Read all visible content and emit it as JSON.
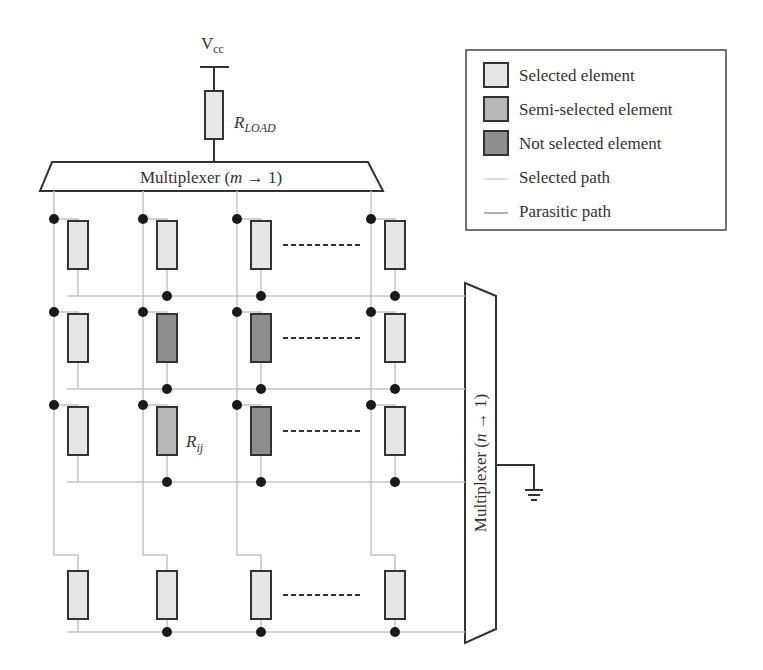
{
  "supply": {
    "label": "V",
    "subscript": "cc"
  },
  "load_resistor": {
    "label": "R",
    "subscript": "LOAD"
  },
  "column_mux": {
    "label": "Multiplexer (",
    "var": "m",
    "arrow": " → 1)"
  },
  "row_mux": {
    "label": "Multiplexer (",
    "var": "n",
    "arrow": " → 1)"
  },
  "cell_label": {
    "label": "R",
    "subscript": "ij"
  },
  "legend": {
    "items": [
      {
        "label": "Selected element",
        "type": "swatch",
        "color": "#e6e6e6"
      },
      {
        "label": "Semi-selected element",
        "type": "swatch",
        "color": "#b8b8b8"
      },
      {
        "label": "Not selected element",
        "type": "swatch",
        "color": "#8e8e8e"
      },
      {
        "label": "Selected path",
        "type": "line",
        "color": "#d0d0d0"
      },
      {
        "label": "Parasitic path",
        "type": "line",
        "color": "#999999"
      }
    ]
  },
  "colors": {
    "selected": "#e6e6e6",
    "semi_selected": "#b8b8b8",
    "not_selected": "#8e8e8e",
    "wire": "#c4c4c4",
    "outline": "#333333"
  },
  "grid": {
    "rows": 4,
    "columns": 4,
    "cells": [
      [
        "selected",
        "selected",
        "selected",
        "selected"
      ],
      [
        "selected",
        "not_selected",
        "not_selected",
        "selected"
      ],
      [
        "selected",
        "semi_selected",
        "not_selected",
        "selected"
      ],
      [
        "selected",
        "selected",
        "selected",
        "selected"
      ]
    ]
  }
}
